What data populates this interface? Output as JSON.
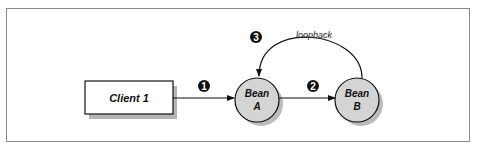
{
  "diagram": {
    "nodes": [
      {
        "id": "client1",
        "label": "Client 1",
        "shape": "rectangle"
      },
      {
        "id": "beanA",
        "label_line1": "Bean",
        "label_line2": "A",
        "shape": "circle"
      },
      {
        "id": "beanB",
        "label_line1": "Bean",
        "label_line2": "B",
        "shape": "circle"
      }
    ],
    "edges": [
      {
        "from": "client1",
        "to": "beanA",
        "step": "1"
      },
      {
        "from": "beanA",
        "to": "beanB",
        "step": "2"
      },
      {
        "from": "beanB",
        "to": "beanA",
        "step": "3",
        "label": "loopback"
      }
    ],
    "colors": {
      "node_fill": "#d4d4d4",
      "stroke": "#111111",
      "badge": "#111111",
      "frame": "#8a8a8a"
    }
  }
}
